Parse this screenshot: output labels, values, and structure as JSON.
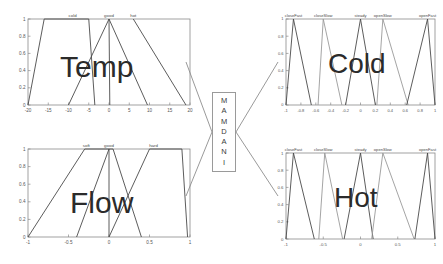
{
  "diagram": {
    "engine_label_letters": [
      "M",
      "A",
      "M",
      "D",
      "A",
      "N",
      "I"
    ],
    "engine_label": "MAMDANI",
    "colors": {
      "background": "#ffffff",
      "axis": "#8a8a8a",
      "curve": "#4a4a4a",
      "curve_light": "#9a9a9a",
      "connector": "#9a9a9a",
      "box_border": "#9a9a9a",
      "big_text": "#2b2b2b",
      "tick_text": "#555555"
    }
  },
  "charts": [
    {
      "id": "temp",
      "big_label": "Temp",
      "role": "input",
      "position": "top-left"
    },
    {
      "id": "flow",
      "big_label": "Flow",
      "role": "input",
      "position": "bottom-left"
    },
    {
      "id": "cold",
      "big_label": "Cold",
      "role": "output",
      "position": "top-right"
    },
    {
      "id": "hot",
      "big_label": "Hot",
      "role": "output",
      "position": "bottom-right"
    }
  ],
  "chart_data": [
    {
      "id": "temp",
      "type": "line",
      "title": "Temp",
      "xlabel": "",
      "ylabel": "",
      "xlim": [
        -20,
        20
      ],
      "ylim": [
        0,
        1
      ],
      "grid": false,
      "legend": "inline-top-labels",
      "xticks": [
        -20,
        -15,
        -10,
        -5,
        0,
        5,
        10,
        15,
        20
      ],
      "xticklabels": [
        "-20",
        "-15",
        "-10",
        "-5",
        "0",
        "5",
        "10",
        "15",
        "20"
      ],
      "yticks": [
        0,
        0.2,
        0.4,
        0.6,
        0.8,
        1
      ],
      "yticklabels": [
        "0",
        "0.2",
        "0.4",
        "0.6",
        "0.8",
        "1"
      ],
      "series": [
        {
          "name": "cold",
          "label_x": -9,
          "points": [
            [
              -20,
              0
            ],
            [
              -16,
              1
            ],
            [
              -5,
              1
            ],
            [
              -3.5,
              0
            ]
          ]
        },
        {
          "name": "good",
          "label_x": 0,
          "points": [
            [
              -10,
              0
            ],
            [
              0,
              1
            ],
            [
              0,
              1
            ],
            [
              0.2,
              0
            ]
          ]
        },
        {
          "name": "hot",
          "label_x": 6,
          "points": [
            [
              0,
              1
            ],
            [
              0,
              1
            ],
            [
              9.5,
              0
            ]
          ]
        },
        {
          "name": "hot-wide",
          "label_x": null,
          "points": [
            [
              6,
              1
            ],
            [
              19,
              0
            ]
          ]
        }
      ]
    },
    {
      "id": "flow",
      "type": "line",
      "title": "Flow",
      "xlabel": "",
      "ylabel": "",
      "xlim": [
        -1,
        1
      ],
      "ylim": [
        0,
        1
      ],
      "grid": false,
      "legend": "inline-top-labels",
      "xticks": [
        -1,
        -0.5,
        0,
        0.5,
        1
      ],
      "xticklabels": [
        "-1",
        "-0.5",
        "0",
        "0.5",
        "1"
      ],
      "yticks": [
        0,
        0.2,
        0.4,
        0.6,
        0.8,
        1
      ],
      "yticklabels": [
        "0",
        "0.2",
        "0.4",
        "0.6",
        "0.8",
        "1"
      ],
      "series": [
        {
          "name": "soft",
          "label_x": -0.28,
          "points": [
            [
              -1,
              0
            ],
            [
              -0.3,
              1
            ],
            [
              0,
              1
            ],
            [
              0,
              0
            ]
          ]
        },
        {
          "name": "good",
          "label_x": 0.0,
          "points": [
            [
              -0.4,
              0
            ],
            [
              0,
              1
            ],
            [
              0.05,
              1
            ],
            [
              0.4,
              0
            ]
          ]
        },
        {
          "name": "hard",
          "label_x": 0.55,
          "points": [
            [
              0,
              0
            ],
            [
              0.5,
              1
            ],
            [
              0.9,
              1
            ],
            [
              0.97,
              0
            ]
          ]
        }
      ]
    },
    {
      "id": "cold",
      "type": "line",
      "title": "Cold",
      "xlabel": "",
      "ylabel": "",
      "xlim": [
        -1,
        1
      ],
      "ylim": [
        0,
        1
      ],
      "grid": false,
      "legend": "inline-top-labels",
      "xticks": [
        -1,
        -0.8,
        -0.6,
        -0.4,
        -0.2,
        0,
        0.2,
        0.4,
        0.6,
        0.8,
        1
      ],
      "xticklabels": [
        "-1",
        "-0.8",
        "-0.6",
        "-0.4",
        "-0.2",
        "0",
        "0.2",
        "0.4",
        "0.6",
        "0.8",
        "1"
      ],
      "yticks": [
        0,
        0.2,
        0.4,
        0.6,
        0.8,
        1
      ],
      "yticklabels": [
        "0",
        "0.2",
        "0.4",
        "0.6",
        "0.8",
        "1"
      ],
      "series": [
        {
          "name": "closeFast",
          "label_x": -0.9,
          "points": [
            [
              -1,
              0
            ],
            [
              -0.9,
              1
            ],
            [
              -0.66,
              0
            ]
          ]
        },
        {
          "name": "closeSlow",
          "label_x": -0.5,
          "points": [
            [
              -0.57,
              0
            ],
            [
              -0.5,
              1
            ],
            [
              -0.25,
              0
            ]
          ]
        },
        {
          "name": "steady",
          "label_x": 0.0,
          "points": [
            [
              -0.2,
              0
            ],
            [
              0,
              1
            ],
            [
              0.2,
              0
            ]
          ]
        },
        {
          "name": "openSlow",
          "label_x": 0.3,
          "points": [
            [
              0.22,
              0
            ],
            [
              0.3,
              1
            ],
            [
              0.64,
              0
            ]
          ]
        },
        {
          "name": "openFast",
          "label_x": 0.9,
          "points": [
            [
              0.62,
              0
            ],
            [
              0.9,
              1
            ],
            [
              1,
              0
            ]
          ]
        }
      ]
    },
    {
      "id": "hot",
      "type": "line",
      "title": "Hot",
      "xlabel": "",
      "ylabel": "",
      "xlim": [
        -1,
        1
      ],
      "ylim": [
        0,
        1
      ],
      "grid": false,
      "legend": "inline-top-labels",
      "xticks": [
        -1,
        -0.5,
        0,
        0.5,
        1
      ],
      "xticklabels": [
        "-1",
        "-0.5",
        "0",
        "0.5",
        "1"
      ],
      "yticks": [
        0,
        0.2,
        0.4,
        0.6,
        0.8,
        1
      ],
      "yticklabels": [
        "0",
        "0.2",
        "0.4",
        "0.6",
        "0.8",
        "1"
      ],
      "series": [
        {
          "name": "closeFast",
          "label_x": -0.9,
          "points": [
            [
              -1,
              0
            ],
            [
              -0.9,
              1
            ],
            [
              -0.62,
              0
            ]
          ]
        },
        {
          "name": "closeSlow",
          "label_x": -0.5,
          "points": [
            [
              -0.56,
              0
            ],
            [
              -0.48,
              1
            ],
            [
              -0.24,
              0
            ]
          ]
        },
        {
          "name": "steady",
          "label_x": 0.0,
          "points": [
            [
              -0.22,
              0
            ],
            [
              0,
              1
            ],
            [
              0.17,
              0
            ]
          ]
        },
        {
          "name": "openSlow",
          "label_x": 0.3,
          "points": [
            [
              0.15,
              0
            ],
            [
              0.3,
              1
            ],
            [
              0.72,
              0
            ]
          ]
        },
        {
          "name": "openFast",
          "label_x": 0.9,
          "points": [
            [
              0.73,
              0
            ],
            [
              0.9,
              1
            ],
            [
              1,
              0
            ]
          ]
        }
      ]
    }
  ],
  "connectors": [
    {
      "name": "temp-to-engine",
      "from": "temp",
      "to": "engine"
    },
    {
      "name": "flow-to-engine",
      "from": "flow",
      "to": "engine"
    },
    {
      "name": "engine-to-cold",
      "from": "engine",
      "to": "cold"
    },
    {
      "name": "engine-to-hot",
      "from": "engine",
      "to": "hot"
    }
  ]
}
